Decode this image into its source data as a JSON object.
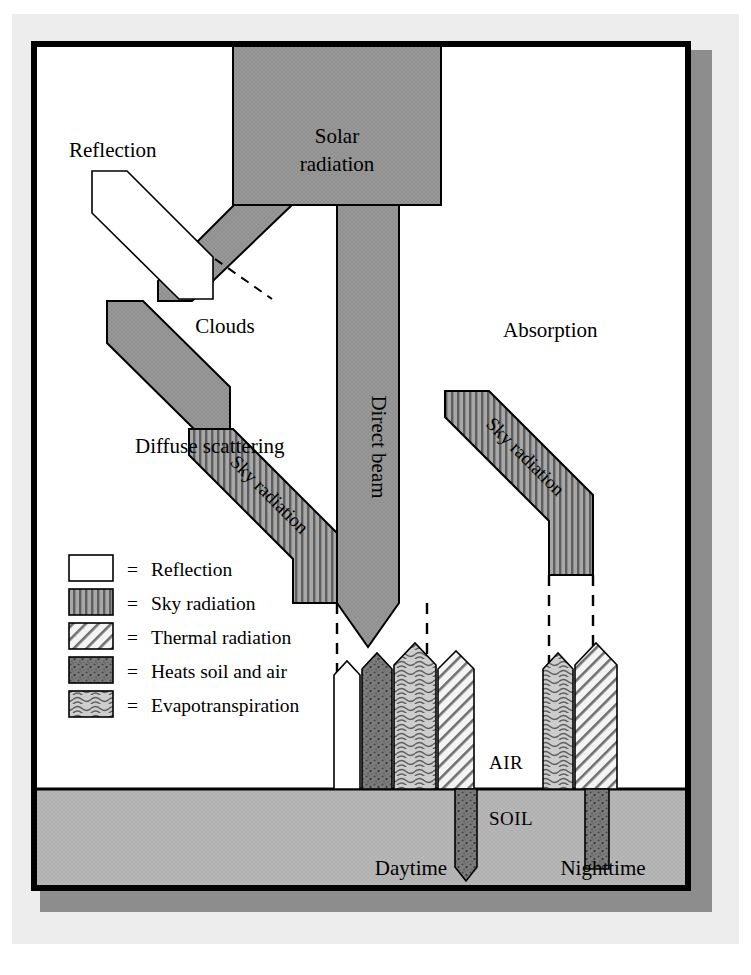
{
  "figure": {
    "title_semantic": "solar-radiation-energy-balance",
    "labels": {
      "solar_radiation_line1": "Solar",
      "solar_radiation_line2": "radiation",
      "reflection": "Reflection",
      "clouds": "Clouds",
      "absorption": "Absorption",
      "diffuse_scattering": "Diffuse scattering",
      "direct_beam": "Direct beam",
      "sky_radiation_left": "Sky radiation",
      "sky_radiation_right": "Sky radiation",
      "air": "AIR",
      "soil": "SOIL",
      "daytime": "Daytime",
      "nighttime": "Nighttime"
    },
    "legend": {
      "equals": "=",
      "items": [
        {
          "pattern": "white",
          "label": "Reflection"
        },
        {
          "pattern": "vertical-stripes",
          "label": "Sky radiation"
        },
        {
          "pattern": "diagonal-hatch",
          "label": "Thermal radiation"
        },
        {
          "pattern": "dark-speckle",
          "label": "Heats soil and air"
        },
        {
          "pattern": "wavy",
          "label": "Evapotranspiration"
        }
      ]
    },
    "colors": {
      "beam_gray": "#959595",
      "soil_gray": "#b5b5b5",
      "paper_gray": "#ededed",
      "shadow_gray": "#8d8d8d",
      "frame_black": "#000000",
      "white": "#ffffff",
      "dark_speckle": "#7a7a7a",
      "wavy_fill": "#c9c9c9",
      "hatch_fill": "#f2f2f2"
    },
    "flows": {
      "daytime_surface_arrows": [
        {
          "name": "reflection",
          "pattern": "white",
          "direction": "up"
        },
        {
          "name": "heats-soil-and-air",
          "pattern": "dark-speckle",
          "direction": "up"
        },
        {
          "name": "evapotranspiration",
          "pattern": "wavy",
          "direction": "up"
        },
        {
          "name": "thermal-radiation",
          "pattern": "diagonal-hatch",
          "direction": "up"
        }
      ],
      "daytime_soil_arrow": {
        "name": "heats-soil-and-air",
        "pattern": "dark-speckle",
        "direction": "down"
      },
      "nighttime_surface_arrows": [
        {
          "name": "evapotranspiration",
          "pattern": "wavy",
          "direction": "up"
        },
        {
          "name": "thermal-radiation",
          "pattern": "diagonal-hatch",
          "direction": "up"
        }
      ],
      "nighttime_soil_arrow": {
        "name": "heats-soil-and-air",
        "pattern": "dark-speckle",
        "direction": "down"
      }
    }
  }
}
